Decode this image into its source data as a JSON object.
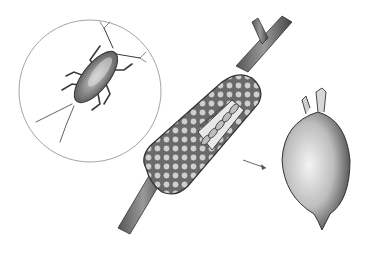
{
  "illustration": {
    "background": "#ffffff",
    "ink": "#3a3a3a",
    "panels": [
      {
        "name": "insect-inset",
        "description": "magnified nymph insect inside circle"
      },
      {
        "name": "egg-mass-on-twig",
        "description": "cellular egg mass wrapped around a twig, cut-away showing eggs"
      },
      {
        "name": "single-egg",
        "description": "isolated oval egg with stalks at top"
      }
    ]
  }
}
